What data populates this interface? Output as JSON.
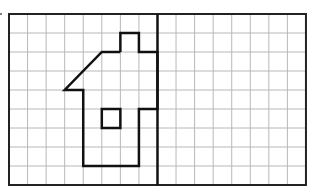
{
  "diagram": {
    "type": "grid-drawing",
    "grid": {
      "cols": 16,
      "rows": 9,
      "origin_x": 9,
      "origin_y": 14,
      "cell_w": 18.56,
      "cell_h": 19
    },
    "symmetry_line_col": 8,
    "house_outline": [
      [
        6,
        2
      ],
      [
        6,
        1
      ],
      [
        7,
        1
      ],
      [
        7,
        2
      ],
      [
        8,
        2
      ],
      [
        8,
        5
      ],
      [
        7,
        5
      ],
      [
        7,
        8
      ],
      [
        4,
        8
      ],
      [
        4,
        4
      ],
      [
        3,
        4
      ],
      [
        5,
        2
      ],
      [
        6,
        2
      ]
    ],
    "window": [
      [
        5,
        5
      ],
      [
        6,
        5
      ],
      [
        6,
        6
      ],
      [
        5,
        6
      ]
    ],
    "colors": {
      "grid": "#b8b8b8",
      "border": "#222222",
      "shape": "#111111"
    }
  }
}
